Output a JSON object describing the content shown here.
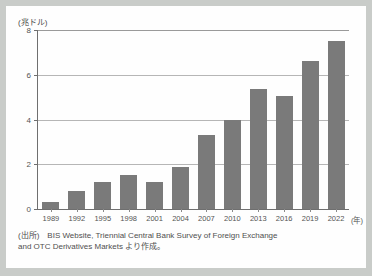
{
  "chart_data": {
    "type": "bar",
    "title": "",
    "subtitle": "",
    "ylabel": "(兆ドル)",
    "xlabel": "(年)",
    "categories": [
      "1989",
      "1992",
      "1995",
      "1998",
      "2001",
      "2004",
      "2007",
      "2010",
      "2013",
      "2016",
      "2019",
      "2022"
    ],
    "values": [
      0.3,
      0.8,
      1.2,
      1.5,
      1.2,
      1.9,
      3.3,
      4.0,
      5.35,
      5.05,
      6.6,
      7.5
    ],
    "series": [
      {
        "name": "外国為替取引高",
        "values": [
          0.3,
          0.8,
          1.2,
          1.5,
          1.2,
          1.9,
          3.3,
          4.0,
          5.35,
          5.05,
          6.6,
          7.5
        ]
      }
    ],
    "ylim": [
      0,
      8
    ],
    "yticks": [
      0,
      2,
      4,
      6,
      8
    ],
    "ytick_labels": [
      "0",
      "2",
      "4",
      "6",
      "8"
    ],
    "grid": true,
    "legend": false,
    "legend_position": "none",
    "bar_color": "#7a7a7a",
    "axis_color": "#6f6f6f",
    "grid_color": "#b6b6b6",
    "background": "#fefefe"
  },
  "source": {
    "line1": "(出所)　BIS Website, Triennial Central Bank Survey of Foreign Exchange",
    "line2": "and OTC Derivatives Markets より作成。"
  }
}
